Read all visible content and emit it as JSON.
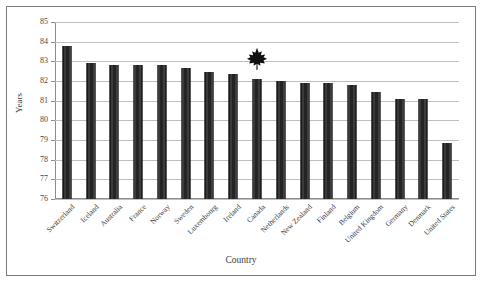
{
  "chart_data": {
    "type": "bar",
    "title": "",
    "xlabel": "Country",
    "ylabel": "Years",
    "ylim": [
      76,
      85
    ],
    "ytick_step": 1,
    "yticks": [
      85,
      84,
      83,
      82,
      81,
      80,
      79,
      78,
      77,
      76
    ],
    "grid": true,
    "legend": "none",
    "bar_color": "#2b2b2b",
    "categories": [
      "Switzerland",
      "Iceland",
      "Australia",
      "France",
      "Norway",
      "Sweden",
      "Luxembourg",
      "Ireland",
      "Canada",
      "Netherlands",
      "New Zealand",
      "Finland",
      "Belgium",
      "United Kingdom",
      "Germany",
      "Denmark",
      "United States"
    ],
    "values": [
      83.8,
      82.9,
      82.8,
      82.8,
      82.8,
      82.65,
      82.45,
      82.35,
      82.1,
      82.0,
      81.9,
      81.9,
      81.8,
      81.45,
      81.1,
      81.1,
      78.85
    ],
    "annotations": [
      {
        "name": "maple-leaf-marker",
        "icon": "maple-leaf-icon",
        "category": "Canada",
        "value": 83.0,
        "color": "#111111"
      }
    ]
  }
}
